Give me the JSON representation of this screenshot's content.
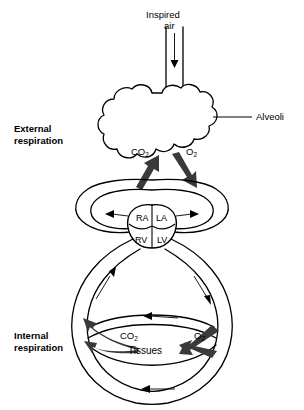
{
  "figure": {
    "background_color": "#ffffff",
    "line_color": "#000000",
    "gas_arrow_color": "#3a3a3a"
  },
  "labels": {
    "inspired_air_line1": "Inspired",
    "inspired_air_line2": "air",
    "alveoli": "Alveoli",
    "external_respiration_line1": "External",
    "external_respiration_line2": "respiration",
    "internal_respiration_line1": "Internal",
    "internal_respiration_line2": "respiration",
    "tissues": "Tissues"
  },
  "gases": {
    "co2_symbol": "CO",
    "co2_subscript": "2",
    "o2_symbol": "O",
    "o2_subscript": "2"
  },
  "heart": {
    "chambers": [
      {
        "id": "ra",
        "label": "RA",
        "name": "right-atrium"
      },
      {
        "id": "la",
        "label": "LA",
        "name": "left-atrium"
      },
      {
        "id": "rv",
        "label": "RV",
        "name": "right-ventricle"
      },
      {
        "id": "lv",
        "label": "LV",
        "name": "left-ventricle"
      }
    ]
  },
  "regions": {
    "external": {
      "co2_direction": "into alveoli",
      "o2_direction": "into blood"
    },
    "internal": {
      "co2_direction": "into blood",
      "o2_direction": "into tissues"
    }
  }
}
